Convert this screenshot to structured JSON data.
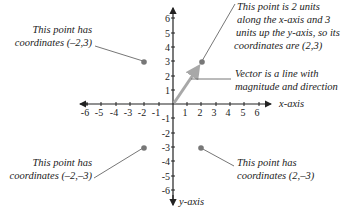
{
  "diagram": {
    "axes": {
      "x_label": "x-axis",
      "y_label": "y-axis",
      "x_ticks": [
        "-6",
        "-5",
        "-4",
        "-3",
        "-2",
        "-1",
        "1",
        "2",
        "3",
        "4",
        "5",
        "6"
      ],
      "y_ticks": [
        "6",
        "5",
        "4",
        "3",
        "2",
        "1",
        "-1",
        "-2",
        "-3",
        "-4",
        "-5",
        "-6"
      ]
    },
    "points": [
      {
        "coords": "(-2,3)",
        "x": -2,
        "y": 3
      },
      {
        "coords": "(2,3)",
        "x": 2,
        "y": 3
      },
      {
        "coords": "(-2,-3)",
        "x": -2,
        "y": -3
      },
      {
        "coords": "(2,-3)",
        "x": 2,
        "y": -3
      }
    ],
    "annotations": {
      "top_left": {
        "line1": "This point has",
        "line2": "coordinates (–2,3)"
      },
      "top_right": {
        "line1": "This point is 2 units",
        "line2": "along the x-axis and 3",
        "line3": "units up the y-axis, so its",
        "line4": "coordinates are (2,3)"
      },
      "vector": {
        "line1": "Vector is a line with",
        "line2": "magnitude and direction"
      },
      "bottom_left": {
        "line1": "This point has",
        "line2": "coordinates (–2,–3)"
      },
      "bottom_right": {
        "line1": "This point has",
        "line2": "coordinates (2,–3)"
      }
    },
    "colors": {
      "axis": "#222222",
      "point": "#777777",
      "vector": "#a8a8a8",
      "leader": "#666666"
    }
  }
}
